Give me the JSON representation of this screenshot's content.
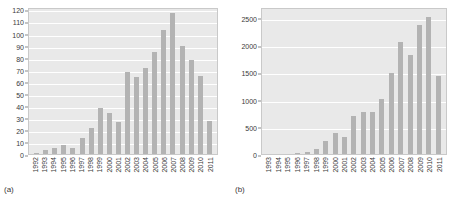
{
  "figure": {
    "panels": [
      {
        "caption": "(a)",
        "chart_data": {
          "type": "bar",
          "title": "",
          "xlabel": "",
          "ylabel": "",
          "ylim": [
            0,
            122
          ],
          "yticks": [
            0,
            10,
            20,
            30,
            40,
            50,
            60,
            70,
            80,
            90,
            100,
            110,
            120
          ],
          "grid": true,
          "legend": "none",
          "categories": [
            "1992",
            "1993",
            "1994",
            "1995",
            "1996",
            "1997",
            "1998",
            "1999",
            "2000",
            "2001",
            "2002",
            "2003",
            "2004",
            "2005",
            "2006",
            "2007",
            "2008",
            "2009",
            "2010",
            "2011"
          ],
          "values": [
            1,
            3,
            5,
            8,
            5,
            13.5,
            22,
            38.5,
            34.5,
            27,
            69,
            64.5,
            72,
            85.5,
            104,
            118.5,
            91,
            79.5,
            65.5,
            28
          ]
        }
      },
      {
        "caption": "(b)",
        "chart_data": {
          "type": "bar",
          "title": "",
          "xlabel": "",
          "ylabel": "",
          "ylim": [
            0,
            2700
          ],
          "yticks": [
            0,
            500,
            1000,
            1500,
            2000,
            2500
          ],
          "grid": true,
          "legend": "none",
          "categories": [
            "1993",
            "1994",
            "1995",
            "1996",
            "1997",
            "1998",
            "1999",
            "2000",
            "2001",
            "2002",
            "2003",
            "2004",
            "2005",
            "2006",
            "2007",
            "2008",
            "2009",
            "2010",
            "2011"
          ],
          "values": [
            0,
            0,
            3,
            15,
            35,
            85,
            240,
            395,
            310,
            715,
            775,
            790,
            1020,
            1510,
            2090,
            1835,
            2410,
            2560,
            1445
          ]
        }
      }
    ]
  },
  "colors": {
    "bar": "#b3b3b3",
    "plot_background": "#e9e9e9",
    "gridline": "#ffffff",
    "text": "#3a3a3a"
  }
}
